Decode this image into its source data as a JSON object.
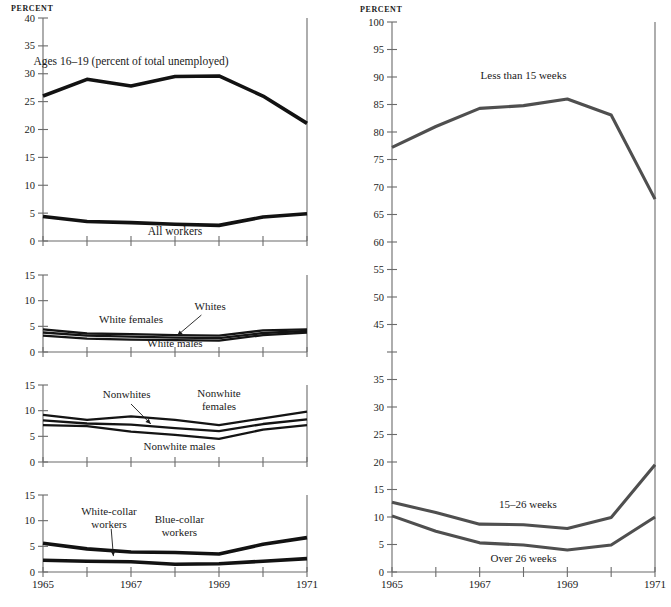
{
  "figure": {
    "width": 671,
    "height": 607,
    "background": "#ffffff",
    "line_color_left": "#121212",
    "line_color_right": "#4f6161"
  },
  "chart_data": [
    {
      "id": "panel-unemployment-rates-teens-all",
      "type": "line",
      "title": "",
      "xlabel": "",
      "ylabel": "PERCENT",
      "axis_label": "PERCENT",
      "x": [
        1965,
        1966,
        1967,
        1968,
        1969,
        1970,
        1971
      ],
      "xlim": [
        1965,
        1971
      ],
      "ylim": [
        0,
        40
      ],
      "yticks": [
        0,
        5,
        10,
        15,
        20,
        25,
        30,
        35,
        40
      ],
      "ytick_labels": [
        "0",
        "5",
        "10",
        "15",
        "20",
        "25",
        "30",
        "35",
        "40"
      ],
      "xticks": [
        1965,
        1966,
        1967,
        1968,
        1969,
        1970,
        1971
      ],
      "xtick_labels": [
        "1965",
        "",
        "1967",
        "",
        "1969",
        "",
        "1971"
      ],
      "grid": false,
      "legend": "inline-annotations",
      "series": [
        {
          "name": "Ages 16–19 (percent of total unemployed)",
          "label": "Ages 16–19 (percent of total unemployed)",
          "values": [
            26.0,
            29.0,
            27.8,
            29.5,
            29.6,
            26.0,
            21.1
          ],
          "label_x": 1967.0,
          "label_y": 31.6,
          "anchor": "middle",
          "weight": "thick"
        },
        {
          "name": "All workers",
          "label": "All workers",
          "values": [
            4.4,
            3.5,
            3.3,
            3.0,
            2.8,
            4.3,
            4.9
          ],
          "label_x": 1968.0,
          "label_y": 1.1,
          "anchor": "middle",
          "weight": "thick"
        }
      ]
    },
    {
      "id": "panel-white-unemployment",
      "type": "line",
      "title": "",
      "xlabel": "",
      "ylabel": "",
      "axis_label": "",
      "x": [
        1965,
        1966,
        1967,
        1968,
        1969,
        1970,
        1971
      ],
      "xlim": [
        1965,
        1971
      ],
      "ylim": [
        0,
        15
      ],
      "yticks": [
        0,
        5,
        10,
        15
      ],
      "ytick_labels": [
        "0",
        "5",
        "10",
        "15"
      ],
      "xticks": [
        1965,
        1966,
        1967,
        1968,
        1969,
        1970,
        1971
      ],
      "xtick_labels": [
        "",
        "",
        "",
        "",
        "",
        "",
        ""
      ],
      "grid": false,
      "legend": "inline-annotations",
      "series": [
        {
          "name": "White females",
          "label": "White females",
          "values": [
            4.4,
            3.6,
            3.5,
            3.3,
            3.2,
            4.2,
            4.4
          ],
          "label_x": 1967.0,
          "label_y": 5.6,
          "anchor": "middle",
          "weight": "thin"
        },
        {
          "name": "Whites",
          "label": "Whites",
          "values": [
            3.8,
            3.2,
            3.0,
            2.8,
            2.7,
            3.7,
            4.1
          ],
          "label_x": 1968.8,
          "label_y": 8.2,
          "anchor": "middle",
          "weight": "thin",
          "leader": {
            "x1": 1968.6,
            "y1": 7.2,
            "x2": 1968.05,
            "y2": 3.2
          }
        },
        {
          "name": "White males",
          "label": "White males",
          "values": [
            3.2,
            2.6,
            2.4,
            2.3,
            2.2,
            3.3,
            3.8
          ],
          "label_x": 1968.0,
          "label_y": 0.9,
          "anchor": "middle",
          "weight": "thin"
        }
      ]
    },
    {
      "id": "panel-nonwhite-unemployment",
      "type": "line",
      "title": "",
      "xlabel": "",
      "ylabel": "",
      "axis_label": "",
      "x": [
        1965,
        1966,
        1967,
        1968,
        1969,
        1970,
        1971
      ],
      "xlim": [
        1965,
        1971
      ],
      "ylim": [
        0,
        15
      ],
      "yticks": [
        0,
        5,
        10,
        15
      ],
      "ytick_labels": [
        "0",
        "5",
        "10",
        "15"
      ],
      "xticks": [
        1965,
        1966,
        1967,
        1968,
        1969,
        1970,
        1971
      ],
      "xtick_labels": [
        "",
        "",
        "",
        "",
        "",
        "",
        ""
      ],
      "grid": false,
      "legend": "inline-annotations",
      "series": [
        {
          "name": "Nonwhite females",
          "label": "Nonwhite females",
          "label_line1": "Nonwhite",
          "label_line2": "females",
          "values": [
            9.2,
            8.2,
            8.9,
            8.2,
            7.2,
            8.5,
            9.8
          ],
          "label_x": 1969.0,
          "label_y": 12.6,
          "anchor": "middle",
          "weight": "thin"
        },
        {
          "name": "Nonwhites",
          "label": "Nonwhites",
          "values": [
            8.1,
            7.5,
            7.3,
            6.6,
            6.0,
            7.4,
            8.3
          ],
          "label_x": 1966.9,
          "label_y": 12.4,
          "anchor": "middle",
          "weight": "thin",
          "leader": {
            "x1": 1967.0,
            "y1": 11.3,
            "x2": 1967.45,
            "y2": 7.4
          }
        },
        {
          "name": "Nonwhite males",
          "label": "Nonwhite males",
          "values": [
            7.2,
            7.0,
            5.9,
            5.3,
            4.5,
            6.3,
            7.2
          ],
          "label_x": 1968.1,
          "label_y": 2.3,
          "anchor": "middle",
          "weight": "thin"
        }
      ]
    },
    {
      "id": "panel-occupation-unemployment",
      "type": "line",
      "title": "",
      "xlabel": "",
      "ylabel": "",
      "axis_label": "",
      "x": [
        1965,
        1966,
        1967,
        1968,
        1969,
        1970,
        1971
      ],
      "xlim": [
        1965,
        1971
      ],
      "ylim": [
        0,
        15
      ],
      "yticks": [
        0,
        5,
        10,
        15
      ],
      "ytick_labels": [
        "0",
        "5",
        "10",
        "15"
      ],
      "xticks": [
        1965,
        1966,
        1967,
        1968,
        1969,
        1970,
        1971
      ],
      "xtick_labels": [
        "1965",
        "",
        "1967",
        "",
        "1969",
        "",
        "1971"
      ],
      "grid": false,
      "legend": "inline-annotations",
      "series": [
        {
          "name": "Blue-collar workers",
          "label": "Blue-collar workers",
          "label_line1": "Blue-collar",
          "label_line2": "workers",
          "values": [
            5.6,
            4.5,
            3.9,
            3.8,
            3.5,
            5.4,
            6.7
          ],
          "label_x": 1968.1,
          "label_y": 9.6,
          "anchor": "middle",
          "weight": "thick"
        },
        {
          "name": "White-collar workers",
          "label": "White-collar workers",
          "label_line1": "White-collar",
          "label_line2": "workers",
          "values": [
            2.3,
            2.1,
            2.0,
            1.5,
            1.6,
            2.1,
            2.6
          ],
          "label_x": 1966.5,
          "label_y": 11.2,
          "anchor": "middle",
          "weight": "thick",
          "leader": {
            "x1": 1966.55,
            "y1": 8.4,
            "x2": 1966.6,
            "y2": 3.1
          }
        }
      ]
    },
    {
      "id": "panel-duration-of-unemployment",
      "type": "line",
      "title": "",
      "xlabel": "",
      "ylabel": "PERCENT",
      "axis_label": "PERCENT",
      "x": [
        1965,
        1966,
        1967,
        1968,
        1969,
        1970,
        1971
      ],
      "xlim": [
        1965,
        1971
      ],
      "ylim": [
        0,
        100
      ],
      "yticks": [
        0,
        5,
        10,
        15,
        20,
        25,
        30,
        35,
        40,
        45,
        50,
        55,
        60,
        65,
        70,
        75,
        80,
        85,
        90,
        95,
        100
      ],
      "ytick_labels": [
        "0",
        "5",
        "10",
        "15",
        "20",
        "25",
        "30",
        "35",
        "",
        "45",
        "50",
        "55",
        "60",
        "65",
        "70",
        "75",
        "80",
        "85",
        "90",
        "95",
        "100"
      ],
      "xticks": [
        1965,
        1966,
        1967,
        1968,
        1969,
        1970,
        1971
      ],
      "xtick_labels": [
        "1965",
        "",
        "1967",
        "",
        "1969",
        "",
        "1971"
      ],
      "grid": false,
      "legend": "inline-annotations",
      "series": [
        {
          "name": "Less than 15 weeks",
          "label": "Less than 15 weeks",
          "values": [
            77.2,
            81.0,
            84.3,
            84.8,
            86.0,
            83.1,
            67.8
          ],
          "label_x": 1968.0,
          "label_y": 89.6,
          "anchor": "middle",
          "weight": "right"
        },
        {
          "name": "15–26 weeks",
          "label": "15–26 weeks",
          "values": [
            12.7,
            10.8,
            8.7,
            8.6,
            7.9,
            9.9,
            19.5
          ],
          "label_x": 1968.1,
          "label_y": 11.6,
          "anchor": "middle",
          "weight": "right"
        },
        {
          "name": "Over 26 weeks",
          "label": "Over 26 weeks",
          "values": [
            10.2,
            7.4,
            5.3,
            4.9,
            4.0,
            4.9,
            10.0
          ],
          "label_x": 1968.0,
          "label_y": 1.9,
          "anchor": "middle",
          "weight": "right"
        }
      ]
    }
  ]
}
